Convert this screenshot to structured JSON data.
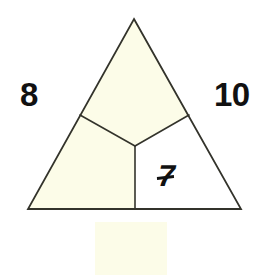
{
  "figure": {
    "background_color": "#ffffff",
    "stroke_color": "#33332b",
    "label_color": "#111111",
    "fill_cream": "#fcfce8",
    "fill_white": "#ffffff",
    "outline": {
      "apex": [
        134,
        19
      ],
      "bottom_left": [
        28,
        209
      ],
      "bottom_right": [
        241,
        209
      ]
    },
    "interior": {
      "center_point": [
        135,
        146
      ],
      "spoke_left_end": [
        80,
        115
      ],
      "spoke_right_end": [
        189,
        115
      ],
      "spoke_bottom_end": [
        135,
        209
      ]
    },
    "regions": [
      {
        "name": "top-region",
        "fill": "#fcfce8"
      },
      {
        "name": "lower-left-region",
        "fill": "#fcfce8"
      },
      {
        "name": "lower-right-region",
        "fill": "#ffffff"
      }
    ],
    "labels": {
      "left": "8",
      "right": "10",
      "interior": "7"
    },
    "artifact": {
      "x": 95,
      "y": 222,
      "width": 72,
      "height": 53,
      "color": "#fcfce8"
    }
  }
}
